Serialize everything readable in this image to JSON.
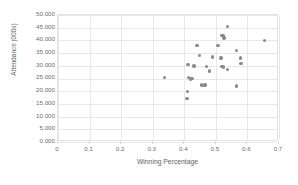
{
  "chart_data": {
    "type": "scatter",
    "title": "",
    "xlabel": "Winning Percentage",
    "ylabel": "Attendance (000s)",
    "xlim": [
      0,
      0.7
    ],
    "ylim": [
      0,
      50.0
    ],
    "xticks": [
      "0",
      "0.1",
      "0.2",
      "0.3",
      "0.4",
      "0.5",
      "0.6",
      "0.7"
    ],
    "xtick_values": [
      0,
      0.1,
      0.2,
      0.3,
      0.4,
      0.5,
      0.6,
      0.7
    ],
    "yticks": [
      "0.000",
      "5.000",
      "10.000",
      "15.000",
      "20.000",
      "25.000",
      "30.000",
      "35.000",
      "40.000",
      "45.000",
      "50.000"
    ],
    "ytick_values": [
      0,
      5,
      10,
      15,
      20,
      25,
      30,
      35,
      40,
      45,
      50
    ],
    "grid": true,
    "legend": false,
    "marker_color": "#8a8a8a",
    "points": [
      {
        "x": 0.537,
        "y": 45.5
      },
      {
        "x": 0.519,
        "y": 42.0
      },
      {
        "x": 0.524,
        "y": 41.8
      },
      {
        "x": 0.526,
        "y": 41.0
      },
      {
        "x": 0.655,
        "y": 40.0
      },
      {
        "x": 0.44,
        "y": 38.0
      },
      {
        "x": 0.507,
        "y": 38.0
      },
      {
        "x": 0.566,
        "y": 36.0
      },
      {
        "x": 0.449,
        "y": 34.0
      },
      {
        "x": 0.49,
        "y": 33.5
      },
      {
        "x": 0.516,
        "y": 33.0
      },
      {
        "x": 0.578,
        "y": 33.0
      },
      {
        "x": 0.58,
        "y": 31.0
      },
      {
        "x": 0.412,
        "y": 30.5
      },
      {
        "x": 0.431,
        "y": 30.0
      },
      {
        "x": 0.47,
        "y": 29.8
      },
      {
        "x": 0.519,
        "y": 29.8
      },
      {
        "x": 0.524,
        "y": 29.5
      },
      {
        "x": 0.536,
        "y": 28.5
      },
      {
        "x": 0.48,
        "y": 28.0
      },
      {
        "x": 0.338,
        "y": 25.5
      },
      {
        "x": 0.413,
        "y": 25.3
      },
      {
        "x": 0.419,
        "y": 24.8
      },
      {
        "x": 0.424,
        "y": 25.0
      },
      {
        "x": 0.455,
        "y": 22.5
      },
      {
        "x": 0.462,
        "y": 22.3
      },
      {
        "x": 0.466,
        "y": 22.5
      },
      {
        "x": 0.566,
        "y": 22.0
      },
      {
        "x": 0.41,
        "y": 20.0
      },
      {
        "x": 0.409,
        "y": 17.2
      }
    ]
  },
  "axes": {
    "ylabel_text": "Attendance (000s)",
    "xlabel_text": "Winning Percentage"
  }
}
